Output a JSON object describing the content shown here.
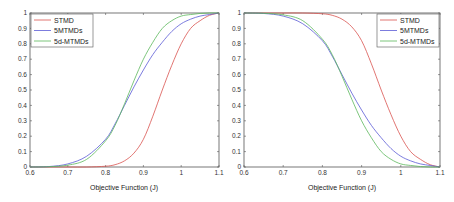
{
  "chart_data": [
    {
      "type": "line",
      "title": "",
      "xlabel": "Objective Function (J)",
      "ylabel": "",
      "xlim": [
        0.6,
        1.1
      ],
      "ylim": [
        0,
        1
      ],
      "xticks": [
        "0.6",
        "0.7",
        "0.8",
        "0.9",
        "1",
        "1.1"
      ],
      "yticks": [
        "0",
        "0.1",
        "0.2",
        "0.3",
        "0.4",
        "0.5",
        "0.6",
        "0.7",
        "0.8",
        "0.9",
        "1"
      ],
      "grid": false,
      "legend_position": "upper left",
      "x": [
        0.6,
        0.65,
        0.7,
        0.75,
        0.8,
        0.825,
        0.85,
        0.875,
        0.9,
        0.925,
        0.95,
        0.975,
        1.0,
        1.025,
        1.05,
        1.075,
        1.1
      ],
      "series": [
        {
          "name": "STMD",
          "color": "#d9534f",
          "values": [
            0,
            0,
            0,
            0,
            0.005,
            0.015,
            0.04,
            0.09,
            0.18,
            0.33,
            0.5,
            0.66,
            0.8,
            0.9,
            0.95,
            0.985,
            1.0
          ]
        },
        {
          "name": "5MTMDs",
          "color": "#5b5bd6",
          "values": [
            0,
            0.003,
            0.02,
            0.07,
            0.18,
            0.28,
            0.4,
            0.52,
            0.63,
            0.73,
            0.81,
            0.88,
            0.93,
            0.96,
            0.98,
            0.99,
            1.0
          ]
        },
        {
          "name": "5d-MTMDs",
          "color": "#5cb85c",
          "values": [
            0,
            0.002,
            0.012,
            0.05,
            0.17,
            0.27,
            0.41,
            0.56,
            0.7,
            0.81,
            0.9,
            0.95,
            0.98,
            0.99,
            0.997,
            1.0,
            1.0
          ]
        }
      ]
    },
    {
      "type": "line",
      "title": "",
      "xlabel": "Objective Function (J)",
      "ylabel": "",
      "xlim": [
        0.6,
        1.1
      ],
      "ylim": [
        0,
        1
      ],
      "xticks": [
        "0.6",
        "0.7",
        "0.8",
        "0.9",
        "1",
        "1.1"
      ],
      "yticks": [
        "0",
        "0.1",
        "0.2",
        "0.3",
        "0.4",
        "0.5",
        "0.6",
        "0.7",
        "0.8",
        "0.9",
        "1"
      ],
      "grid": false,
      "legend_position": "upper right",
      "x": [
        0.6,
        0.65,
        0.7,
        0.75,
        0.8,
        0.825,
        0.85,
        0.875,
        0.9,
        0.925,
        0.95,
        0.975,
        1.0,
        1.025,
        1.05,
        1.075,
        1.1
      ],
      "series": [
        {
          "name": "STMD",
          "color": "#d9534f",
          "values": [
            1,
            1,
            1,
            1,
            0.995,
            0.985,
            0.96,
            0.91,
            0.82,
            0.67,
            0.5,
            0.34,
            0.2,
            0.1,
            0.05,
            0.015,
            0.0
          ]
        },
        {
          "name": "5MTMDs",
          "color": "#5b5bd6",
          "values": [
            1,
            0.997,
            0.98,
            0.93,
            0.82,
            0.72,
            0.6,
            0.48,
            0.37,
            0.27,
            0.19,
            0.12,
            0.07,
            0.04,
            0.02,
            0.01,
            0.0
          ]
        },
        {
          "name": "5d-MTMDs",
          "color": "#5cb85c",
          "values": [
            1,
            0.998,
            0.988,
            0.95,
            0.83,
            0.73,
            0.59,
            0.44,
            0.3,
            0.19,
            0.1,
            0.05,
            0.02,
            0.01,
            0.003,
            0.0,
            0.0
          ]
        }
      ]
    }
  ],
  "plots": [
    {
      "xlabel": "Objective Function (J)",
      "legend": [
        "STMD",
        "5MTMDs",
        "5d-MTMDs"
      ]
    },
    {
      "xlabel": "Objective Function (J)",
      "legend": [
        "STMD",
        "5MTMDs",
        "5d-MTMDs"
      ]
    }
  ]
}
